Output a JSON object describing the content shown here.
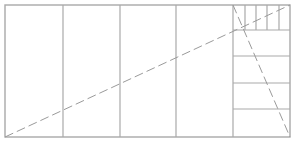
{
  "diagram": {
    "type": "golden-rectangle-style subdivision",
    "colors": {
      "line": "#a9a9a9",
      "dash": "#9a9a9a",
      "background": "#ffffff"
    },
    "outer_rect": {
      "x": 5,
      "y": 5,
      "w": 285,
      "h": 132
    },
    "vertical_dividers_x": [
      63,
      120,
      176,
      233
    ],
    "right_panel": {
      "x": 233,
      "x2": 290,
      "horizontal_dividers_y": [
        30,
        56,
        83,
        109
      ],
      "top_strip": {
        "y1": 5,
        "y2": 30,
        "vertical_dividers_x": [
          245,
          256,
          267,
          279
        ]
      }
    },
    "dashed_diagonals": [
      {
        "x1": 5,
        "y1": 137,
        "x2": 290,
        "y2": 5
      },
      {
        "x1": 233,
        "y1": 5,
        "x2": 290,
        "y2": 137
      }
    ]
  }
}
